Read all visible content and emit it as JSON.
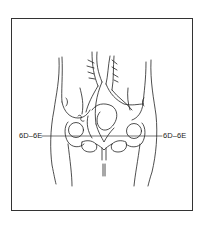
{
  "figure": {
    "line_color": "#222222",
    "frame_color": "#333333",
    "background": "#ffffff"
  },
  "labels": {
    "left": "6D–6E",
    "right": "6D–6E"
  }
}
